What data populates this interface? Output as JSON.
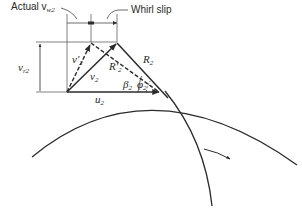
{
  "diagram": {
    "type": "velocity-triangle",
    "labels": {
      "actual_vw2": "Actual v",
      "actual_vw2_sub": "w2",
      "whirl_slip": "Whirl slip",
      "vr2": "v",
      "vr2_sub": "r2",
      "v2_prime": "v'",
      "v2_prime_sub": "2",
      "v2": "v",
      "v2_sub": "2",
      "R2_prime": "R'",
      "R2_prime_sub": "2",
      "R2": "R",
      "R2_sub": "2",
      "beta2": "β",
      "beta2_sub": "2",
      "phi2": "φ",
      "phi2_sub": "2",
      "u2": "u",
      "u2_sub": "2"
    },
    "colors": {
      "line": "#2b2b2b",
      "background": "#ffffff"
    }
  }
}
